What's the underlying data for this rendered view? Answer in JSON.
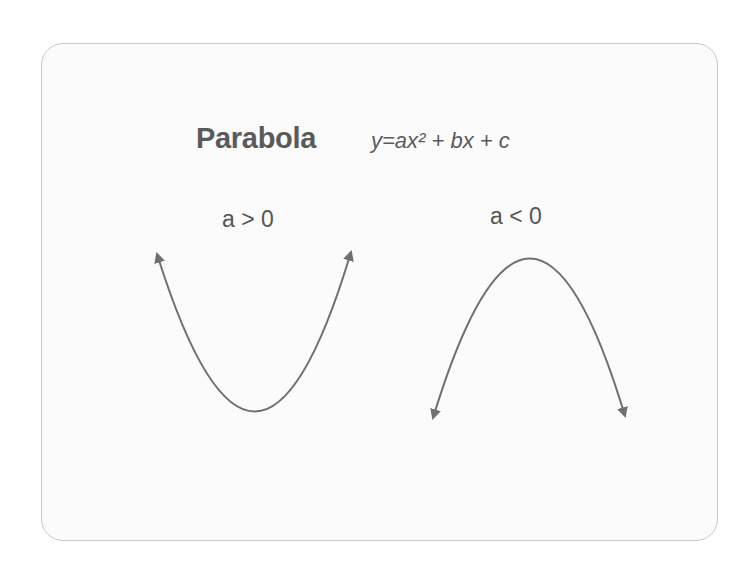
{
  "diagram": {
    "title": "Parabola",
    "equation": "y=ax² + bx + c",
    "panels": [
      {
        "label": "a > 0",
        "shape": "upward-opening parabola"
      },
      {
        "label": "a < 0",
        "shape": "downward-opening parabola"
      }
    ]
  },
  "colors": {
    "text": "#5a5a5a",
    "curve": "#707070",
    "card_border": "#c9c9c9",
    "card_bg": "#fbfbfb"
  }
}
